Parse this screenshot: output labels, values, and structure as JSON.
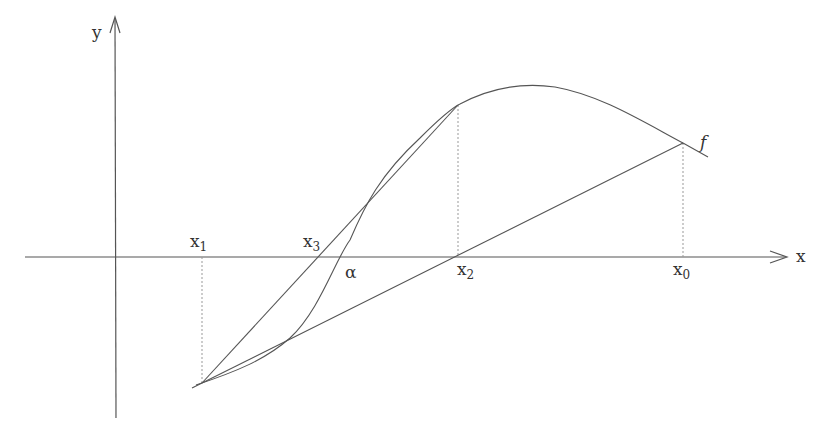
{
  "diagram": {
    "axes": {
      "x_label": "x",
      "y_label": "y"
    },
    "function_label": "f",
    "root_label": "α",
    "points": [
      {
        "name": "x",
        "sub": "1",
        "px": 202
      },
      {
        "name": "x",
        "sub": "3",
        "px": 318
      },
      {
        "name": "x",
        "sub": "2",
        "px": 458
      },
      {
        "name": "x",
        "sub": "0",
        "px": 683
      }
    ],
    "colors": {
      "stroke": "#555555",
      "dotted": "#999999",
      "text": "#333333",
      "background": "#ffffff"
    }
  }
}
